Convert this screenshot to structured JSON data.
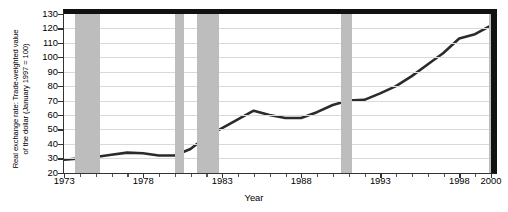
{
  "chart_data": {
    "type": "line",
    "title": "",
    "xlabel": "Year",
    "ylabel": "Real exchange rate: Trade-weighted value of the dollar (January 1997 = 100)",
    "ylabel_line1": "Real exchange rate: Trade-weighted value",
    "ylabel_line2": "of the dollar (January 1997 = 100)",
    "xlim": [
      1973,
      2000
    ],
    "ylim": [
      20,
      130
    ],
    "grid": true,
    "legend": "none",
    "line_color": "#2b2b2b",
    "band_color": "#bdbdbd",
    "gridline_color": "#d9d9d9",
    "ytick_labels": [
      "130",
      "120",
      "110",
      "100",
      "90",
      "80",
      "70",
      "60",
      "50",
      "40",
      "30",
      "20"
    ],
    "ytick_values": [
      130,
      120,
      110,
      100,
      90,
      80,
      70,
      60,
      50,
      40,
      30,
      20
    ],
    "xtick_labels": [
      "1973",
      "1978",
      "1983",
      "1988",
      "1993",
      "1998",
      "2000"
    ],
    "xtick_values": [
      1973,
      1978,
      1983,
      1988,
      1993,
      1998,
      2000
    ],
    "xminor_values": [
      1974,
      1975,
      1976,
      1977,
      1979,
      1980,
      1981,
      1982,
      1984,
      1985,
      1986,
      1987,
      1989,
      1990,
      1991,
      1992,
      1994,
      1995,
      1996,
      1997,
      1999
    ],
    "series": [
      {
        "name": "Trade-weighted value of the dollar",
        "x": [
          1973.0,
          1974.0,
          1975.0,
          1976.0,
          1977.0,
          1978.0,
          1979.0,
          1980.0,
          1981.0,
          1982.0,
          1983.0,
          1984.0,
          1985.0,
          1986.0,
          1987.0,
          1988.0,
          1989.0,
          1990.0,
          1991.0,
          1992.0,
          1993.0,
          1994.0,
          1995.0,
          1996.0,
          1997.0,
          1998.0,
          1999.0,
          2000.0
        ],
        "y": [
          29.0,
          30.0,
          31.0,
          32.5,
          34.0,
          33.5,
          32.0,
          32.0,
          36.5,
          45.0,
          51.0,
          57.0,
          63.0,
          60.0,
          58.0,
          58.0,
          62.0,
          67.0,
          70.0,
          70.5,
          75.0,
          80.0,
          87.0,
          95.0,
          103.0,
          113.0,
          116.0,
          122.0
        ]
      }
    ],
    "shaded_bands": [
      {
        "label": "recession",
        "start": 1973.7,
        "end": 1975.3
      },
      {
        "start": 1980.0,
        "end": 1980.6
      },
      {
        "start": 1981.4,
        "end": 1982.8
      },
      {
        "start": 1990.5,
        "end": 1991.2
      },
      {
        "start": 1999.9,
        "end": 2000.0
      }
    ]
  }
}
